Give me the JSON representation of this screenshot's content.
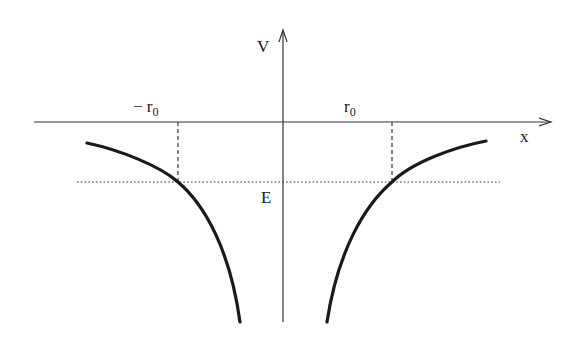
{
  "diagram": {
    "title": "",
    "axes": {
      "x_label": "x",
      "y_label": "V"
    },
    "labels": {
      "neg_r0_prefix": "− r",
      "neg_r0_sub": "0",
      "r0_main": "r",
      "r0_sub": "0",
      "energy": "E"
    },
    "colors": {
      "curve": "#1a1a1a",
      "axis": "#333333",
      "guide": "#333333",
      "background": "#ffffff"
    }
  }
}
